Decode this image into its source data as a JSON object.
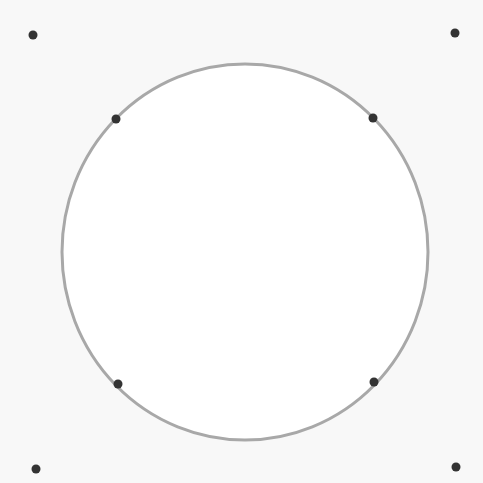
{
  "canvas": {
    "width": 483,
    "height": 483,
    "background": "#f8f8f8"
  },
  "shape": {
    "type": "ellipse",
    "cx": 245,
    "cy": 252,
    "rx": 183,
    "ry": 188,
    "fill": "#ffffff",
    "stroke": "#a8a8a8",
    "stroke_width": 3
  },
  "points": [
    {
      "id": "outer-top-left",
      "x": 33,
      "y": 35
    },
    {
      "id": "outer-top-right",
      "x": 455,
      "y": 33
    },
    {
      "id": "outer-bottom-left",
      "x": 36,
      "y": 469
    },
    {
      "id": "outer-bottom-right",
      "x": 456,
      "y": 467
    },
    {
      "id": "on-circle-top-left",
      "x": 116,
      "y": 119
    },
    {
      "id": "on-circle-top-right",
      "x": 373,
      "y": 118
    },
    {
      "id": "on-circle-bottom-left",
      "x": 118,
      "y": 384
    },
    {
      "id": "on-circle-bottom-right",
      "x": 374,
      "y": 382
    }
  ],
  "point_style": {
    "r": 4.5,
    "fill": "#333333"
  }
}
